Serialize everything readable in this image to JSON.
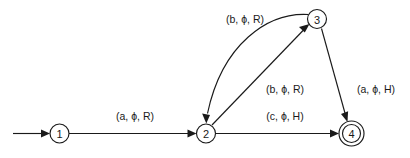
{
  "diagram": {
    "type": "finite-state-transition-diagram",
    "background_color": "#ffffff",
    "stroke_color": "#1a1a1a",
    "states": [
      {
        "id": "1",
        "label": "1",
        "cx": 59.5,
        "cy": 133.5,
        "r": 9.5,
        "accepting": false,
        "start": true
      },
      {
        "id": "2",
        "label": "2",
        "cx": 206,
        "cy": 133.5,
        "r": 9.5,
        "accepting": false,
        "start": false
      },
      {
        "id": "3",
        "label": "3",
        "cx": 317,
        "cy": 19,
        "r": 9.5,
        "accepting": false,
        "start": false
      },
      {
        "id": "4",
        "label": "4",
        "cx": 351.5,
        "cy": 133.5,
        "r": 9.5,
        "r_outer": 12.5,
        "accepting": true,
        "start": false
      }
    ],
    "start_arrow": {
      "from_x": 13,
      "to_x": 50,
      "y": 133.5
    },
    "transitions": [
      {
        "id": "t1",
        "from": "1",
        "to": "2",
        "label": "(a, ϕ, R)",
        "label_x": 135,
        "label_y": 116,
        "shape": "straight"
      },
      {
        "id": "t2",
        "from": "3",
        "to": "2",
        "label": "(b, ϕ, R)",
        "label_x": 245,
        "label_y": 19,
        "shape": "curved"
      },
      {
        "id": "t3",
        "from": "2",
        "to": "3",
        "label": "(b, ϕ, R)",
        "label_x": 285,
        "label_y": 89,
        "shape": "straight"
      },
      {
        "id": "t4",
        "from": "3",
        "to": "4",
        "label": "(a, ϕ, H)",
        "label_x": 376,
        "label_y": 89,
        "shape": "straight"
      },
      {
        "id": "t5",
        "from": "2",
        "to": "4",
        "label": "(c, ϕ, H)",
        "label_x": 285,
        "label_y": 116,
        "shape": "straight"
      }
    ]
  }
}
